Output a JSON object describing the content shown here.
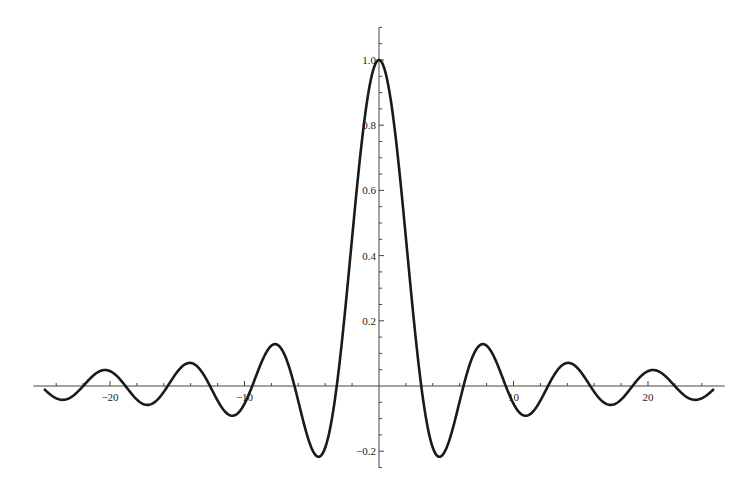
{
  "chart_data": {
    "type": "line",
    "title": "",
    "xlabel": "",
    "ylabel": "",
    "function": "sin(x)/x",
    "xlim": [
      -25.7,
      25.7
    ],
    "ylim": [
      -0.25,
      1.1
    ],
    "domain": [
      -24.9,
      24.9
    ],
    "grid": false,
    "legend": "none",
    "x_major_ticks": [
      -20,
      -10,
      10,
      20
    ],
    "x_tick_labels": [
      "−20",
      "−10",
      "10",
      "20"
    ],
    "x_minor_step": 2,
    "y_major_ticks": [
      -0.2,
      0.2,
      0.4,
      0.6,
      0.8,
      1.0
    ],
    "y_tick_labels": [
      "−0.2",
      "0.2",
      "0.4",
      "0.6",
      "0.8",
      "1.0"
    ],
    "y_minor_step": 0.05,
    "series": [
      {
        "name": "Sinc",
        "color": "#1a1a1a",
        "samples": {
          "x": [
            -24.9,
            -22.0,
            -20.4,
            -18.9,
            -17.2,
            -15.6,
            -14.1,
            -12.5,
            -10.9,
            -9.4,
            -7.7,
            -6.3,
            -4.5,
            -3.14,
            0,
            3.14,
            4.5,
            6.3,
            7.7,
            9.4,
            10.9,
            12.5,
            14.1,
            15.6,
            17.2,
            18.9,
            20.4,
            22.0,
            24.9
          ],
          "y": [
            -0.011,
            -0.0,
            0.049,
            0.0,
            -0.057,
            0.0,
            0.071,
            0.0,
            -0.091,
            0.0,
            0.128,
            0.0,
            -0.217,
            0.0,
            1.0,
            0.0,
            -0.217,
            0.0,
            0.128,
            0.0,
            -0.091,
            0.0,
            0.071,
            0.0,
            -0.057,
            0.0,
            0.049,
            0.0,
            -0.011
          ]
        }
      }
    ]
  }
}
